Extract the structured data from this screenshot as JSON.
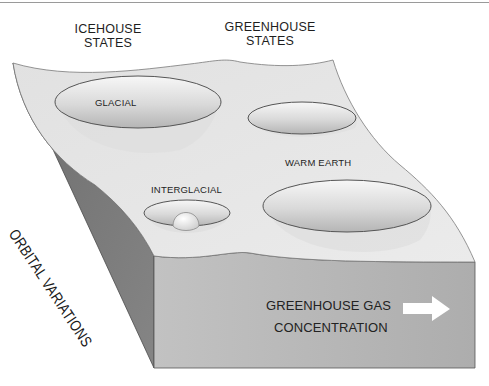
{
  "diagram": {
    "headers": {
      "icehouse": [
        "ICEHOUSE",
        "STATES"
      ],
      "greenhouse": [
        "GREENHOUSE",
        "STATES"
      ]
    },
    "states": {
      "glacial": "GLACIAL",
      "interglacial": "INTERGLACIAL",
      "warm_earth": "WARM EARTH",
      "greenhouse_unlabeled": ""
    },
    "axes": {
      "left_side_label": "ORBITAL VARIATIONS",
      "front_label": [
        "GREENHOUSE GAS",
        "CONCENTRATION"
      ],
      "front_arrow": "right-arrow-icon"
    },
    "colors": {
      "top_surface": "#e6e6e6",
      "front_face": "#b9b9b9",
      "side_face": "#7a7a7a",
      "well_fill_light": "#f4f4f4",
      "well_fill_dark": "#bdbdbd",
      "outline": "#555555",
      "arrow": "#ffffff"
    }
  }
}
